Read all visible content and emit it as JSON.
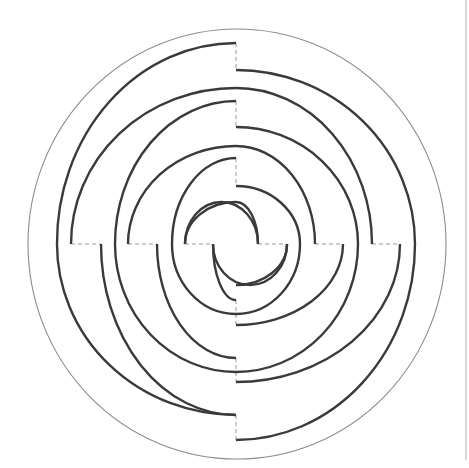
{
  "diagram": {
    "type": "circular-spiral-maze",
    "title": "",
    "colors": {
      "background": "#ffffff",
      "wall": "#3a3a3a",
      "boundary": "#8c8c8c",
      "gap_dash": "#9a9a9a",
      "page_edge": "#c8c8c8"
    },
    "center": [
      236,
      244
    ],
    "boundary_ellipse": {
      "cx": 237,
      "cy": 244,
      "rx": 209,
      "ry": 215
    },
    "page_edge_line": {
      "x": 466,
      "y1": 0,
      "y2": 460
    },
    "horizontal_cut_y": 244,
    "vertical_cut_x": 236,
    "walls": [
      {
        "id": "w1",
        "d": "M 236 43 A 179 201 0 0 0 57 244 A 179 171 0 0 0 236 415"
      },
      {
        "id": "w2",
        "d": "M 236 70 A 165 174 0 0 1 401 244 A 165 196 0 0 1 236 440"
      },
      {
        "id": "w3",
        "d": "M 236 88 A 165 156 0 0 0 71 244"
      },
      {
        "id": "w4",
        "d": "M 101 244 A 135 171 0 0 0 236 415"
      },
      {
        "id": "w5",
        "d": "M 236 101 A 136 143 0 0 1 372 244"
      },
      {
        "id": "w6",
        "d": "M 415 244 A 179 128 0 0 1 236 372"
      },
      {
        "id": "w7",
        "d": "M 236 127 A 122 117 0 0 1 358 244 A 122 128 0 0 1 236 372"
      },
      {
        "id": "w8",
        "d": "M 236 101 A 121 143 0 0 0 115 244 A 121 114 0 0 0 236 358"
      },
      {
        "id": "w9",
        "d": "M 236 146 A 108 98 0 0 0 128 244"
      },
      {
        "id": "w10",
        "d": "M 157 244 A 79 114 0 0 0 236 358"
      },
      {
        "id": "w11",
        "d": "M 236 158 A 79 86 0 0 1 315 244"
      },
      {
        "id": "w12",
        "d": "M 343 244 A 107 70 0 0 1 236 314"
      },
      {
        "id": "w13",
        "d": "M 236 186 A 64 58 0 0 1 300 244 A 64 70 0 0 1 236 314"
      },
      {
        "id": "w14",
        "d": "M 236 158 A 64 86 0 0 0 172 244 A 64 56 0 0 0 236 300"
      },
      {
        "id": "w15",
        "d": "M 236 202 A 51 42 0 0 0 185 244"
      },
      {
        "id": "w16",
        "d": "M 213 244 A 23 56 0 0 0 236 300"
      },
      {
        "id": "w17",
        "d": "M 236 186 A 22 58 0 0 1 258 244"
      },
      {
        "id": "w18",
        "d": "M 287 244 A 51 41 0 0 1 236 285"
      },
      {
        "id": "w19",
        "d": "M 213 244 A 37 41 0 0 0 250 285 A 37 41 0 0 0 287 244"
      },
      {
        "id": "w20",
        "d": "M 185 244 A 36.5 42 0 0 1 258 244"
      },
      {
        "id": "w21",
        "d": "M 236 43 L 236 43"
      }
    ],
    "gaps": [
      {
        "id": "g-top-1",
        "d": "M 236 43 L 236 70"
      },
      {
        "id": "g-top-2",
        "d": "M 236 101 L 236 127"
      },
      {
        "id": "g-top-3",
        "d": "M 236 158 L 236 186"
      },
      {
        "id": "g-bot-1",
        "d": "M 236 300 L 236 325"
      },
      {
        "id": "g-bot-2",
        "d": "M 236 358 L 236 382"
      },
      {
        "id": "g-bot-3",
        "d": "M 236 415 L 236 440"
      },
      {
        "id": "g-left-1",
        "d": "M 71 244 L 101 244"
      },
      {
        "id": "g-left-2",
        "d": "M 128 244 L 157 244"
      },
      {
        "id": "g-left-3",
        "d": "M 185 244 L 213 244"
      },
      {
        "id": "g-right-1",
        "d": "M 258 244 L 287 244"
      },
      {
        "id": "g-right-2",
        "d": "M 315 244 L 343 244"
      },
      {
        "id": "g-right-3",
        "d": "M 372 244 L 400 244"
      }
    ]
  }
}
